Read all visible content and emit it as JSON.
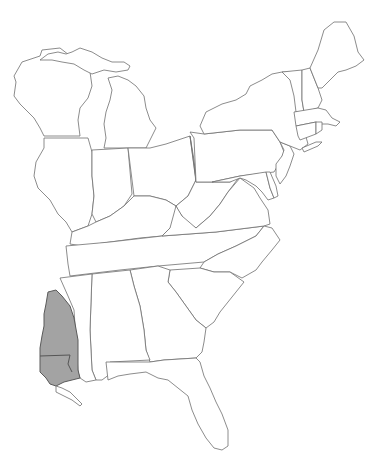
{
  "map": {
    "title": "",
    "region": "Eastern United States",
    "background": "#ffffff",
    "outline_color": "#6e6e6e",
    "highlight": {
      "description": "Shaded range area in southwestern Mississippi / eastern Louisiana",
      "fill": "#a3a3a3",
      "stroke": "#5a5a5a"
    },
    "states": [
      "Wisconsin",
      "Michigan",
      "Illinois",
      "Indiana",
      "Ohio",
      "Kentucky",
      "Tennessee",
      "Mississippi",
      "Alabama",
      "Georgia",
      "Florida",
      "South Carolina",
      "North Carolina",
      "Virginia",
      "West Virginia",
      "Maryland",
      "Delaware",
      "New Jersey",
      "Pennsylvania",
      "New York",
      "Connecticut",
      "Rhode Island",
      "Massachusetts",
      "Vermont",
      "New Hampshire",
      "Maine"
    ]
  }
}
